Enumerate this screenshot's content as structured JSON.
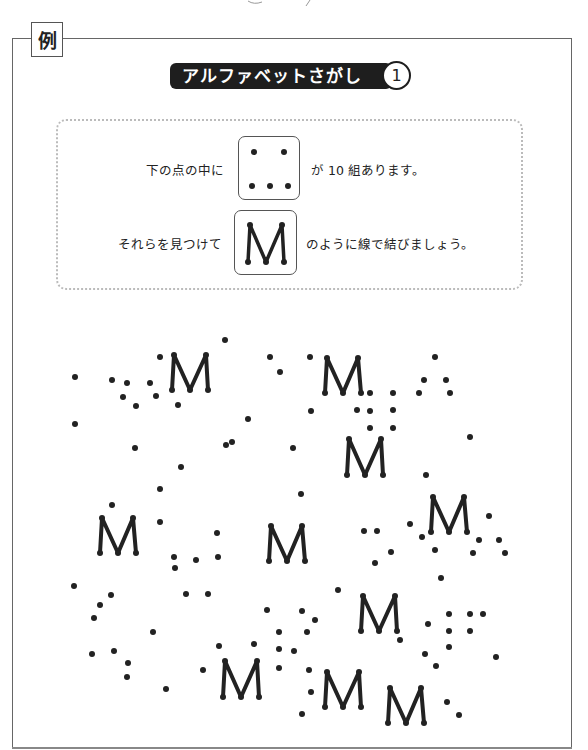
{
  "label": {
    "example_mark": "例"
  },
  "title": {
    "text": "アルファベットさがし",
    "number": "1"
  },
  "instructions": {
    "line1_prefix": "下の点の中に",
    "line1_suffix": "が 10 組あります。",
    "line2_prefix": "それらを見つけて",
    "line2_suffix": "のように線で結びましょう。",
    "pattern_dots_icon": "five-dot-pattern-icon",
    "pattern_letter_icon": "letter-m-connected-icon",
    "pattern_letter": "M",
    "pairs_count": 10
  },
  "colors": {
    "ink": "#222222",
    "frame": "#666666",
    "title_bg": "#1e1e1e",
    "dotted_border": "#bbbbbb"
  },
  "puzzle": {
    "letter": "M",
    "found_letters": [
      {
        "tl": [
          174,
          355
        ],
        "tr": [
          206,
          355
        ],
        "bl": [
          172,
          390
        ],
        "bm": [
          190,
          390
        ],
        "br": [
          208,
          390
        ]
      },
      {
        "tl": [
          327,
          358
        ],
        "tr": [
          358,
          358
        ],
        "bl": [
          325,
          393
        ],
        "bm": [
          343,
          393
        ],
        "br": [
          361,
          393
        ]
      },
      {
        "tl": [
          349,
          439
        ],
        "tr": [
          381,
          439
        ],
        "bl": [
          347,
          475
        ],
        "bm": [
          365,
          475
        ],
        "br": [
          383,
          475
        ]
      },
      {
        "tl": [
          102,
          518
        ],
        "tr": [
          133,
          518
        ],
        "bl": [
          100,
          553
        ],
        "bm": [
          118,
          553
        ],
        "br": [
          136,
          553
        ]
      },
      {
        "tl": [
          271,
          526
        ],
        "tr": [
          302,
          526
        ],
        "bl": [
          269,
          561
        ],
        "bm": [
          287,
          561
        ],
        "br": [
          305,
          561
        ]
      },
      {
        "tl": [
          433,
          497
        ],
        "tr": [
          464,
          497
        ],
        "bl": [
          431,
          532
        ],
        "bm": [
          449,
          532
        ],
        "br": [
          467,
          532
        ]
      },
      {
        "tl": [
          363,
          596
        ],
        "tr": [
          395,
          596
        ],
        "bl": [
          361,
          631
        ],
        "bm": [
          379,
          631
        ],
        "br": [
          397,
          631
        ]
      },
      {
        "tl": [
          225,
          661
        ],
        "tr": [
          257,
          661
        ],
        "bl": [
          223,
          697
        ],
        "bm": [
          241,
          697
        ],
        "br": [
          259,
          697
        ]
      },
      {
        "tl": [
          327,
          672
        ],
        "tr": [
          359,
          672
        ],
        "bl": [
          325,
          707
        ],
        "bm": [
          343,
          707
        ],
        "br": [
          361,
          707
        ]
      },
      {
        "tl": [
          390,
          688
        ],
        "tr": [
          421,
          688
        ],
        "bl": [
          388,
          723
        ],
        "bm": [
          406,
          723
        ],
        "br": [
          424,
          723
        ]
      }
    ],
    "loose_dots": [
      [
        75,
        377
      ],
      [
        75,
        424
      ],
      [
        112,
        380
      ],
      [
        127,
        383
      ],
      [
        150,
        383
      ],
      [
        123,
        397
      ],
      [
        136,
        406
      ],
      [
        156,
        396
      ],
      [
        160,
        357
      ],
      [
        178,
        405
      ],
      [
        225,
        340
      ],
      [
        248,
        419
      ],
      [
        232,
        442
      ],
      [
        135,
        448
      ],
      [
        181,
        467
      ],
      [
        226,
        445
      ],
      [
        270,
        357
      ],
      [
        280,
        372
      ],
      [
        310,
        357
      ],
      [
        311,
        411
      ],
      [
        293,
        448
      ],
      [
        370,
        393
      ],
      [
        393,
        393
      ],
      [
        357,
        410
      ],
      [
        370,
        411
      ],
      [
        393,
        410
      ],
      [
        370,
        428
      ],
      [
        393,
        428
      ],
      [
        435,
        357
      ],
      [
        424,
        380
      ],
      [
        446,
        380
      ],
      [
        419,
        393
      ],
      [
        450,
        393
      ],
      [
        470,
        437
      ],
      [
        426,
        475
      ],
      [
        160,
        489
      ],
      [
        112,
        505
      ],
      [
        160,
        522
      ],
      [
        217,
        533
      ],
      [
        174,
        557
      ],
      [
        175,
        568
      ],
      [
        196,
        560
      ],
      [
        218,
        557
      ],
      [
        74,
        586
      ],
      [
        111,
        595
      ],
      [
        100,
        605
      ],
      [
        94,
        618
      ],
      [
        186,
        594
      ],
      [
        208,
        594
      ],
      [
        301,
        494
      ],
      [
        364,
        531
      ],
      [
        377,
        531
      ],
      [
        410,
        524
      ],
      [
        422,
        537
      ],
      [
        391,
        552
      ],
      [
        375,
        563
      ],
      [
        435,
        550
      ],
      [
        441,
        578
      ],
      [
        338,
        590
      ],
      [
        489,
        516
      ],
      [
        479,
        540
      ],
      [
        499,
        540
      ],
      [
        473,
        553
      ],
      [
        505,
        553
      ],
      [
        267,
        610
      ],
      [
        302,
        611
      ],
      [
        315,
        620
      ],
      [
        279,
        632
      ],
      [
        307,
        632
      ],
      [
        219,
        646
      ],
      [
        254,
        644
      ],
      [
        279,
        649
      ],
      [
        294,
        651
      ],
      [
        279,
        668
      ],
      [
        309,
        670
      ],
      [
        311,
        692
      ],
      [
        302,
        714
      ],
      [
        153,
        632
      ],
      [
        92,
        654
      ],
      [
        114,
        651
      ],
      [
        128,
        663
      ],
      [
        127,
        677
      ],
      [
        166,
        689
      ],
      [
        203,
        670
      ],
      [
        449,
        614
      ],
      [
        470,
        614
      ],
      [
        483,
        614
      ],
      [
        428,
        624
      ],
      [
        449,
        631
      ],
      [
        470,
        631
      ],
      [
        449,
        647
      ],
      [
        400,
        640
      ],
      [
        425,
        654
      ],
      [
        436,
        666
      ],
      [
        496,
        657
      ],
      [
        447,
        702
      ],
      [
        459,
        715
      ]
    ]
  }
}
